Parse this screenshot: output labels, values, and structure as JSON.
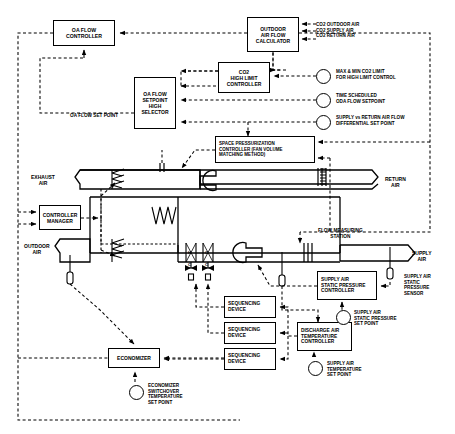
{
  "diagram": {
    "boxes": [
      {
        "id": "oa_flow_controller",
        "lines": [
          "OA FLOW",
          "CONTROLLER"
        ],
        "x": 53,
        "y": 20,
        "w": 62,
        "h": 26,
        "fs": 5.2
      },
      {
        "id": "outdoor_air_flow_calc",
        "lines": [
          "OUTDOOR",
          "AIR FLOW",
          "CALCULATOR"
        ],
        "x": 247,
        "y": 17,
        "w": 52,
        "h": 35,
        "fs": 5.0
      },
      {
        "id": "co2_high_limit_ctrl",
        "lines": [
          "CO2",
          "HIGH LIMIT",
          "CONTROLLER"
        ],
        "x": 218,
        "y": 62,
        "w": 52,
        "h": 31,
        "fs": 5.0
      },
      {
        "id": "oa_flow_sp_high_sel",
        "lines": [
          "OA FLOW",
          "SETPOINT",
          "HIGH",
          "SELECTOR"
        ],
        "x": 134,
        "y": 77,
        "w": 42,
        "h": 52,
        "fs": 5.0
      },
      {
        "id": "space_press_ctrl",
        "lines": [
          "SPACE PRESSURIZATION",
          "CONTROLLER (FAN VOLUME",
          "MATCHING METHOD)"
        ],
        "x": 215,
        "y": 136,
        "w": 100,
        "h": 27,
        "fs": 4.5,
        "align": "left"
      },
      {
        "id": "controller_manager",
        "lines": [
          "CONTROLLER",
          "MANAGER"
        ],
        "x": 39,
        "y": 205,
        "w": 42,
        "h": 25,
        "fs": 5.0
      },
      {
        "id": "supply_air_sp_ctrl",
        "lines": [
          "SUPPLY AIR",
          "STATIC PRESSURE",
          "CONTROLLER"
        ],
        "x": 317,
        "y": 271,
        "w": 60,
        "h": 29,
        "fs": 4.8,
        "align": "left"
      },
      {
        "id": "discharge_air_temp_ctrl",
        "lines": [
          "DISCHARGE AIR",
          "TEMPERATURE",
          "CONTROLLER"
        ],
        "x": 297,
        "y": 322,
        "w": 55,
        "h": 29,
        "fs": 4.8,
        "align": "left"
      },
      {
        "id": "sequencing_device_1",
        "lines": [
          "SEQUENCING",
          "DEVICE"
        ],
        "x": 224,
        "y": 296,
        "w": 52,
        "h": 22,
        "fs": 4.8,
        "align": "left"
      },
      {
        "id": "sequencing_device_2",
        "lines": [
          "SEQUENCING",
          "DEVICE"
        ],
        "x": 224,
        "y": 322,
        "w": 52,
        "h": 22,
        "fs": 4.8,
        "align": "left"
      },
      {
        "id": "sequencing_device_3",
        "lines": [
          "SEQUENCING",
          "DEVICE"
        ],
        "x": 224,
        "y": 348,
        "w": 52,
        "h": 22,
        "fs": 4.8,
        "align": "left"
      },
      {
        "id": "economizer",
        "lines": [
          "ECONOMIZER"
        ],
        "x": 108,
        "y": 348,
        "w": 52,
        "h": 20,
        "fs": 5.0
      }
    ],
    "setpoints": [
      {
        "id": "co2_signals",
        "lines": [
          "CO2 OUTDOOR AIR",
          "CO2 SUPPLY AIR",
          "CO2 RETURN AIR"
        ],
        "x": 316,
        "y": 22,
        "fs": 4.6,
        "circle": false
      },
      {
        "id": "max_min_co2_limit",
        "lines": [
          "MAX & MIN CO2 LIMIT",
          "FOR HIGH LIMIT CONTROL"
        ],
        "x": 336,
        "y": 69,
        "fs": 4.6,
        "cx": 322,
        "cy": 75,
        "circle": true
      },
      {
        "id": "time_scheduled_oda_sp",
        "lines": [
          "TIME SCHEDULED",
          "ODA FLOW SETPOINT"
        ],
        "x": 336,
        "y": 93,
        "fs": 4.6,
        "cx": 322,
        "cy": 99,
        "circle": true
      },
      {
        "id": "supply_return_diff_sp",
        "lines": [
          "SUPPLY vs RETURN AIR FLOW",
          "DIFFERENTIAL SET POINT"
        ],
        "x": 336,
        "y": 115,
        "fs": 4.6,
        "cx": 322,
        "cy": 121,
        "circle": true
      },
      {
        "id": "supply_air_sp_setpoint",
        "lines": [
          "SUPPLY AIR",
          "STATIC PRESSURE",
          "SET POINT"
        ],
        "x": 354,
        "y": 310,
        "fs": 4.6,
        "cx": 342,
        "cy": 316,
        "circle": true
      },
      {
        "id": "supply_air_temp_setpoint",
        "lines": [
          "SUPPLY AIR",
          "TEMPERATURE",
          "SET POINT"
        ],
        "x": 327,
        "y": 361,
        "fs": 4.6,
        "cx": 314,
        "cy": 367,
        "circle": true
      },
      {
        "id": "economizer_switchover_sp",
        "lines": [
          "ECONOMIZER",
          "SWITCHOVER",
          "TEMPERATURE",
          "SET POINT"
        ],
        "x": 148,
        "y": 383,
        "fs": 4.6,
        "cx": 135,
        "cy": 391,
        "circle": true
      }
    ],
    "sensors": [
      {
        "id": "supply_air_static_pressure_sensor",
        "lines": [
          "SUPPLY AIR",
          "STATIC",
          "PRESSURE",
          "SENSOR"
        ],
        "x": 404,
        "y": 274,
        "fs": 4.6
      }
    ],
    "stream_labels": [
      {
        "id": "exhaust_air",
        "lines": [
          "EXHAUST",
          "AIR"
        ],
        "x": 31,
        "y": 174,
        "fs": 5.0
      },
      {
        "id": "outdoor_air",
        "lines": [
          "OUTDOOR",
          "AIR"
        ],
        "x": 24,
        "y": 243,
        "fs": 5.0
      },
      {
        "id": "return_air",
        "lines": [
          "RETURN",
          "AIR"
        ],
        "x": 385,
        "y": 176,
        "fs": 5.0
      },
      {
        "id": "supply_air",
        "lines": [
          "SUPPLY",
          "AIR"
        ],
        "x": 412,
        "y": 250,
        "fs": 5.0
      },
      {
        "id": "flow_measuring_station",
        "lines": [
          "FLOW MEASURING",
          "STATION"
        ],
        "x": 318,
        "y": 228,
        "fs": 4.8
      }
    ],
    "signal_labels": [
      {
        "id": "oa_flow_set_point",
        "text": "OA FLOW SET POINT",
        "x": 70,
        "y": 113,
        "fs": 4.7
      }
    ],
    "coil_labels": [
      {
        "id": "heating_coil_marker",
        "top": "H",
        "bottom": "C",
        "x": 188,
        "y": 251
      },
      {
        "id": "cooling_coil_marker",
        "top": "C",
        "bottom": "C",
        "x": 205,
        "y": 251
      }
    ]
  }
}
